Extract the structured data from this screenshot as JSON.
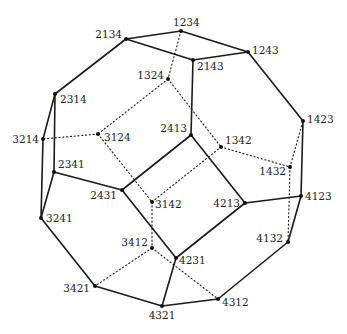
{
  "diagram": {
    "vertices": [
      {
        "id": "1234",
        "x": 181,
        "y": 31,
        "lx": -8,
        "ly": -5,
        "anchor": "start"
      },
      {
        "id": "2134",
        "x": 126,
        "y": 39,
        "lx": -4,
        "ly": -1,
        "anchor": "end"
      },
      {
        "id": "1243",
        "x": 248,
        "y": 52,
        "lx": 4,
        "ly": 2,
        "anchor": "start"
      },
      {
        "id": "2143",
        "x": 193,
        "y": 60,
        "lx": 4,
        "ly": 10,
        "anchor": "start"
      },
      {
        "id": "1324",
        "x": 168,
        "y": 79,
        "lx": -4,
        "ly": 0,
        "anchor": "end"
      },
      {
        "id": "2314",
        "x": 55,
        "y": 94,
        "lx": 5,
        "ly": 9,
        "anchor": "start"
      },
      {
        "id": "3214",
        "x": 43,
        "y": 139,
        "lx": -4,
        "ly": 4,
        "anchor": "end"
      },
      {
        "id": "3124",
        "x": 98,
        "y": 134,
        "lx": 6,
        "ly": 7,
        "anchor": "start"
      },
      {
        "id": "2413",
        "x": 191,
        "y": 135,
        "lx": -4,
        "ly": -3,
        "anchor": "end"
      },
      {
        "id": "1342",
        "x": 221,
        "y": 147,
        "lx": 4,
        "ly": -3,
        "anchor": "start"
      },
      {
        "id": "1423",
        "x": 303,
        "y": 121,
        "lx": 4,
        "ly": 2,
        "anchor": "start"
      },
      {
        "id": "1432",
        "x": 290,
        "y": 167,
        "lx": -4,
        "ly": 8,
        "anchor": "end"
      },
      {
        "id": "2341",
        "x": 54,
        "y": 172,
        "lx": 4,
        "ly": -4,
        "anchor": "start"
      },
      {
        "id": "3241",
        "x": 41,
        "y": 218,
        "lx": 5,
        "ly": 4,
        "anchor": "start"
      },
      {
        "id": "2431",
        "x": 122,
        "y": 190,
        "lx": -5,
        "ly": 9,
        "anchor": "end"
      },
      {
        "id": "3142",
        "x": 152,
        "y": 202,
        "lx": 3,
        "ly": 6,
        "anchor": "start"
      },
      {
        "id": "4213",
        "x": 245,
        "y": 203,
        "lx": -5,
        "ly": 4,
        "anchor": "end"
      },
      {
        "id": "4123",
        "x": 301,
        "y": 196,
        "lx": 4,
        "ly": 4,
        "anchor": "start"
      },
      {
        "id": "4132",
        "x": 288,
        "y": 242,
        "lx": -5,
        "ly": 0,
        "anchor": "end"
      },
      {
        "id": "4231",
        "x": 176,
        "y": 258,
        "lx": 3,
        "ly": 6,
        "anchor": "start"
      },
      {
        "id": "3412",
        "x": 152,
        "y": 248,
        "lx": -4,
        "ly": -2,
        "anchor": "end"
      },
      {
        "id": "3421",
        "x": 95,
        "y": 286,
        "lx": -5,
        "ly": 6,
        "anchor": "end"
      },
      {
        "id": "4321",
        "x": 162,
        "y": 306,
        "lx": 0,
        "ly": 13,
        "anchor": "middle"
      },
      {
        "id": "4312",
        "x": 218,
        "y": 299,
        "lx": 4,
        "ly": 7,
        "anchor": "start"
      }
    ],
    "solid_edges": [
      [
        "1234",
        "2134"
      ],
      [
        "1234",
        "1243"
      ],
      [
        "2134",
        "2143"
      ],
      [
        "1243",
        "2143"
      ],
      [
        "2134",
        "2314"
      ],
      [
        "2314",
        "3214"
      ],
      [
        "2314",
        "2341"
      ],
      [
        "3214",
        "3241"
      ],
      [
        "2341",
        "3241"
      ],
      [
        "2341",
        "2431"
      ],
      [
        "3241",
        "3421"
      ],
      [
        "2143",
        "2413"
      ],
      [
        "2413",
        "2431"
      ],
      [
        "2413",
        "4213"
      ],
      [
        "2431",
        "4231"
      ],
      [
        "4213",
        "4231"
      ],
      [
        "4213",
        "4123"
      ],
      [
        "1243",
        "1423"
      ],
      [
        "1423",
        "4123"
      ],
      [
        "4123",
        "4132"
      ],
      [
        "4132",
        "4312"
      ],
      [
        "4231",
        "4321"
      ],
      [
        "3421",
        "4321"
      ],
      [
        "4321",
        "4312"
      ]
    ],
    "dotted_edges": [
      [
        "1234",
        "1324"
      ],
      [
        "1324",
        "3124"
      ],
      [
        "1324",
        "1342"
      ],
      [
        "3124",
        "3214"
      ],
      [
        "3124",
        "3142"
      ],
      [
        "3142",
        "1342"
      ],
      [
        "1342",
        "1432"
      ],
      [
        "1432",
        "1423"
      ],
      [
        "1432",
        "4132"
      ],
      [
        "3142",
        "3412"
      ],
      [
        "3412",
        "3421"
      ],
      [
        "3412",
        "4312"
      ]
    ]
  }
}
